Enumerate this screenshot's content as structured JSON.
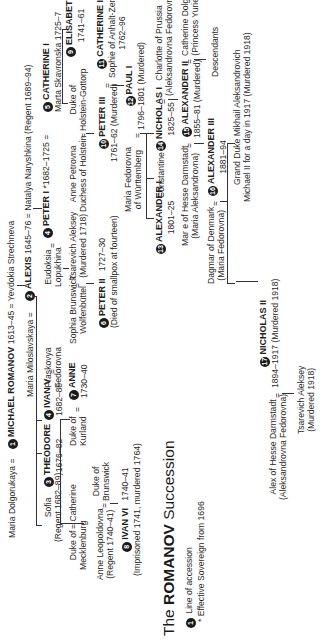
{
  "title": {
    "prefix": "The ",
    "emphasis": "ROMANOV",
    "suffix": " Succession"
  },
  "legend": {
    "line_number": "1",
    "line_label": "Line of accession",
    "star_note": "* Effective Sovereign from 1696"
  },
  "people": {
    "maria_dolgorukaya": {
      "name": "Maria Dolgorukaya"
    },
    "michael": {
      "num": "1",
      "name": "MICHAEL ROMANOV",
      "dates": "1613–45"
    },
    "yevdokia": {
      "name": "Yevdokia Strechneva"
    },
    "maria_miloslavskaya": {
      "name": "Maria Miloslavskaya"
    },
    "alexis": {
      "num": "2",
      "name": "ALEXIS",
      "dates": "1645–76"
    },
    "natalya": {
      "name": "Natalya Naryshkina (Regent 1689–94)"
    },
    "sofia": {
      "name": "Sofia",
      "note": "(Regent 1682–89)"
    },
    "theodore": {
      "num": "3",
      "name": "THEODORE",
      "dates": "1676–82"
    },
    "ivan5": {
      "num": "4",
      "name": "IVAN V",
      "dates": "1682–89"
    },
    "praskovya": {
      "name": "Praskovya",
      "name2": "Fedorovna"
    },
    "eudoksia": {
      "name": "Eudoksia",
      "name2": "Lopukhina"
    },
    "peter1": {
      "num": "4",
      "name": "PETER I",
      "dates": "*1682–1725"
    },
    "catherine1": {
      "num": "5",
      "name": "CATHERINE I",
      "note": "Marta Skavronska 1725–7"
    },
    "elisabeth": {
      "num": "9",
      "name": "ELISABETH",
      "dates": "1741–61"
    },
    "duke_mecklenburg": {
      "name": "Duke of",
      "name2": "Mecklenburg"
    },
    "catherine_iv": {
      "name": "Catherine"
    },
    "duke_kurland": {
      "name": "Duke of",
      "name2": "Kurland"
    },
    "anne": {
      "num": "7",
      "name": "ANNE",
      "dates": "1730–40"
    },
    "sophia_brunswick": {
      "name": "Sophia Brunswick",
      "name2": "Wolfenbüttel"
    },
    "alexey_tsarevich": {
      "name": "Tsarevich Aleksey",
      "note": "(Murdered 1718)"
    },
    "anne_petrovna": {
      "name": "Anne Petrovna",
      "name2": "Duchess of Holstein"
    },
    "duke_holstein": {
      "name": "Duke of",
      "name2": "Holstein-Gottorp"
    },
    "anne_leopoldovna": {
      "name": "Anne Leopoldovna",
      "note": "(Regent 1740–41)"
    },
    "duke_brunswick": {
      "name": "Duke of",
      "name2": "Brunswick"
    },
    "peter2": {
      "num": "6",
      "name": "PETER II",
      "dates": "1727–30",
      "note": "(Died of smallpox at fourteen)"
    },
    "peter3": {
      "num": "10",
      "name": "PETER III",
      "dates": "1761–62",
      "note": "(Murdered)"
    },
    "catherine2": {
      "num": "11",
      "name": "CATHERINE II",
      "note": "Sophie of Anhalt-Zerbst",
      "dates": "1762–96"
    },
    "ivan6": {
      "num": "8",
      "name": "IVAN VI",
      "dates": "1740–41",
      "note": "(Imprisoned 1741, murdered 1764)"
    },
    "maria_fedorovna_w": {
      "name": "Maria Fedorovna",
      "name2": "of Württemberg"
    },
    "paul1": {
      "num": "12",
      "name": "PAUL I",
      "dates": "1796–1801",
      "note": "(Murdered)"
    },
    "alexander1": {
      "num": "13",
      "name": "ALEXANDER I",
      "dates": "1801–25"
    },
    "constantine": {
      "name": "Constantine"
    },
    "nicholas1": {
      "num": "14",
      "name": "NICHOLAS I",
      "dates": "1825–55"
    },
    "charlotte": {
      "name": "Charlotte of Prussia",
      "name2": "(Aleksandrovna Fedorovna)"
    },
    "marie_hesse": {
      "name": "Mar e of Hesse Darmstadt",
      "name2": "(Maria Aleksandrovna)"
    },
    "alexander2": {
      "num": "15",
      "name": "ALEXANDER II",
      "dates": "1855–81",
      "note": "(Murdered)"
    },
    "catherine_dolgorukaya": {
      "name": "Catherine Dolgorukaya",
      "name2": "(Princess Yurievskaya)"
    },
    "descendants": {
      "name": "Descendants"
    },
    "dagmar": {
      "name": "Dagmar of Denmark",
      "name2": "(Maria Fedorovna)"
    },
    "alexander3": {
      "num": "16",
      "name": "ALEXANDER III",
      "dates": "1881–94"
    },
    "mikhail": {
      "name": "Grand Duke Mikhail Aleksandrovich",
      "name2": "Michael II for a day in 1917  (Murdered 1918)"
    },
    "alex_hesse": {
      "name": "Alex of Hesse Darmstadt",
      "name2": "(Aleksandrovna Fedorovna)"
    },
    "nicholas2": {
      "num": "17",
      "name": "NICHOLAS II",
      "dates": "1894–1917",
      "note": "(Murdered 1918)"
    },
    "alexey_last": {
      "name": "Tsarevich Aleksey",
      "note": "(Murdered 1918)"
    }
  },
  "symbols": {
    "marriage": "="
  }
}
